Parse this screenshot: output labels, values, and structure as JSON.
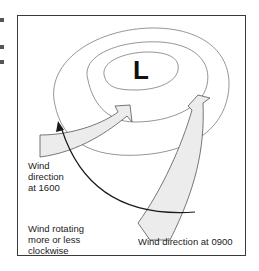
{
  "diagram": {
    "pressure_center": "L",
    "labels": {
      "wind_1600_line1": "Wind",
      "wind_1600_line2": "direction",
      "wind_1600_line3": "at 1600",
      "rotation_line1": "Wind rotating",
      "rotation_line2": "more or less",
      "rotation_line3": "clockwise",
      "wind_0900": "Wind direction at 0900"
    },
    "colors": {
      "isobar": "#7a7a7a",
      "arrow_fill": "#ececec",
      "arrow_stroke": "#555555",
      "rotation_arrow": "#1a1a1a",
      "frame": "#3a3a3a"
    }
  }
}
